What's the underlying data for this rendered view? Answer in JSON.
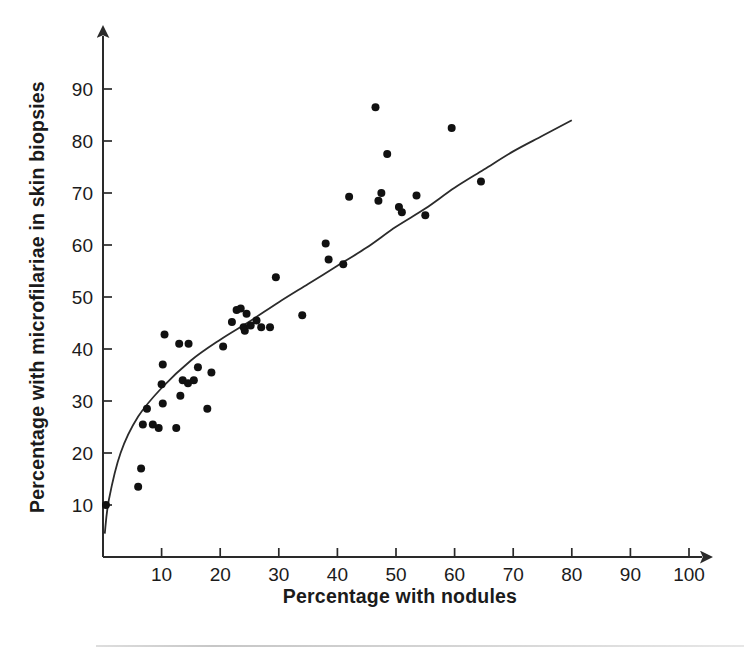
{
  "chart_data": {
    "type": "scatter",
    "title": "",
    "xlabel": "Percentage with nodules",
    "ylabel": "Percentage with microfilariae in skin biopsies",
    "xlim": [
      0,
      105
    ],
    "ylim": [
      0,
      95
    ],
    "xticks": [
      10,
      20,
      30,
      40,
      50,
      60,
      70,
      80,
      90,
      100
    ],
    "yticks": [
      10,
      20,
      30,
      40,
      50,
      60,
      70,
      80,
      90
    ],
    "grid": false,
    "legend": null,
    "axis_arrows": true,
    "points": [
      {
        "x": 0.5,
        "y": 10.0
      },
      {
        "x": 6.0,
        "y": 13.5
      },
      {
        "x": 6.5,
        "y": 17.0
      },
      {
        "x": 7.5,
        "y": 28.5
      },
      {
        "x": 6.8,
        "y": 25.5
      },
      {
        "x": 8.5,
        "y": 25.5
      },
      {
        "x": 9.5,
        "y": 24.8
      },
      {
        "x": 10.2,
        "y": 29.5
      },
      {
        "x": 10.0,
        "y": 33.2
      },
      {
        "x": 10.2,
        "y": 37.0
      },
      {
        "x": 10.5,
        "y": 42.8
      },
      {
        "x": 12.5,
        "y": 24.8
      },
      {
        "x": 13.2,
        "y": 31.0
      },
      {
        "x": 13.6,
        "y": 34.0
      },
      {
        "x": 14.5,
        "y": 33.4
      },
      {
        "x": 15.5,
        "y": 34.0
      },
      {
        "x": 13.0,
        "y": 41.0
      },
      {
        "x": 14.6,
        "y": 41.0
      },
      {
        "x": 16.2,
        "y": 36.5
      },
      {
        "x": 17.8,
        "y": 28.5
      },
      {
        "x": 18.5,
        "y": 35.5
      },
      {
        "x": 20.5,
        "y": 40.5
      },
      {
        "x": 22.0,
        "y": 45.2
      },
      {
        "x": 22.8,
        "y": 47.5
      },
      {
        "x": 23.5,
        "y": 47.8
      },
      {
        "x": 24.0,
        "y": 44.2
      },
      {
        "x": 24.2,
        "y": 43.5
      },
      {
        "x": 24.5,
        "y": 46.8
      },
      {
        "x": 25.2,
        "y": 44.5
      },
      {
        "x": 26.2,
        "y": 45.5
      },
      {
        "x": 27.0,
        "y": 44.2
      },
      {
        "x": 28.5,
        "y": 44.2
      },
      {
        "x": 29.5,
        "y": 53.8
      },
      {
        "x": 34.0,
        "y": 46.5
      },
      {
        "x": 38.0,
        "y": 60.3
      },
      {
        "x": 38.5,
        "y": 57.2
      },
      {
        "x": 41.0,
        "y": 56.3
      },
      {
        "x": 42.0,
        "y": 69.3
      },
      {
        "x": 46.5,
        "y": 86.5
      },
      {
        "x": 47.0,
        "y": 68.5
      },
      {
        "x": 47.5,
        "y": 70.0
      },
      {
        "x": 48.5,
        "y": 77.5
      },
      {
        "x": 50.5,
        "y": 67.3
      },
      {
        "x": 51.0,
        "y": 66.3
      },
      {
        "x": 53.5,
        "y": 69.5
      },
      {
        "x": 55.0,
        "y": 65.7
      },
      {
        "x": 59.5,
        "y": 82.5
      },
      {
        "x": 64.5,
        "y": 72.2
      }
    ],
    "fit_curve": {
      "description": "logarithmic best-fit line through scatter",
      "x_start": 0.2,
      "x_end": 80.0,
      "y_start": 5.0,
      "y_end": 84.0,
      "sample_points": [
        {
          "x": 0.3,
          "y": 4.5
        },
        {
          "x": 1.0,
          "y": 11.0
        },
        {
          "x": 3.0,
          "y": 20.0
        },
        {
          "x": 6.0,
          "y": 27.0
        },
        {
          "x": 10.0,
          "y": 32.5
        },
        {
          "x": 15.0,
          "y": 37.8
        },
        {
          "x": 20.0,
          "y": 41.8
        },
        {
          "x": 25.0,
          "y": 45.3
        },
        {
          "x": 30.0,
          "y": 49.0
        },
        {
          "x": 35.0,
          "y": 52.5
        },
        {
          "x": 40.0,
          "y": 56.0
        },
        {
          "x": 45.0,
          "y": 59.5
        },
        {
          "x": 50.0,
          "y": 63.5
        },
        {
          "x": 55.0,
          "y": 67.0
        },
        {
          "x": 60.0,
          "y": 71.0
        },
        {
          "x": 65.0,
          "y": 74.5
        },
        {
          "x": 70.0,
          "y": 78.0
        },
        {
          "x": 75.0,
          "y": 81.0
        },
        {
          "x": 80.0,
          "y": 84.0
        }
      ]
    }
  },
  "axes": {
    "x_title": "Percentage with nodules",
    "y_title": "Percentage with microfilariae in skin biopsies",
    "x_tick_labels": [
      "10",
      "20",
      "30",
      "40",
      "50",
      "60",
      "70",
      "80",
      "90",
      "100"
    ],
    "y_tick_labels": [
      "10",
      "20",
      "30",
      "40",
      "50",
      "60",
      "70",
      "80",
      "90"
    ]
  },
  "colors": {
    "axis": "#2a2a2a",
    "point": "#111111",
    "curve": "#2b2b2b",
    "text": "#1b1b1b",
    "background": "#ffffff"
  }
}
